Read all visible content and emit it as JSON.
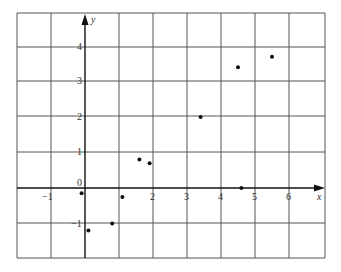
{
  "chart_data": {
    "type": "scatter",
    "title": "",
    "xlabel": "x",
    "ylabel": "y",
    "xlim": [
      -2,
      7
    ],
    "ylim": [
      -2,
      5
    ],
    "grid": true,
    "legend": null,
    "x_ticks": [
      "-1",
      "2",
      "3",
      "4",
      "5",
      "6"
    ],
    "y_ticks": [
      "-1",
      "1",
      "2",
      "3",
      "4"
    ],
    "origin_label": "0",
    "series": [
      {
        "name": "points",
        "x": [
          -0.1,
          0.1,
          0.8,
          1.1,
          1.6,
          1.9,
          3.4,
          4.5,
          5.5,
          4.6
        ],
        "y": [
          -0.15,
          -1.2,
          -1.0,
          -0.25,
          0.8,
          0.7,
          2.0,
          3.4,
          3.7,
          0.0
        ]
      }
    ]
  },
  "labels": {
    "x_axis": "x",
    "y_axis": "y",
    "origin": "0",
    "xt_m1": "−1",
    "xt_2": "2",
    "xt_3": "3",
    "xt_4": "4",
    "xt_5": "5",
    "xt_6": "6",
    "yt_m1": "−1",
    "yt_1": "1",
    "yt_2": "2",
    "yt_3": "3",
    "yt_4": "4"
  },
  "style": {
    "point_color": "#111111",
    "grid_color": "#555555",
    "axis_color": "#111111"
  }
}
